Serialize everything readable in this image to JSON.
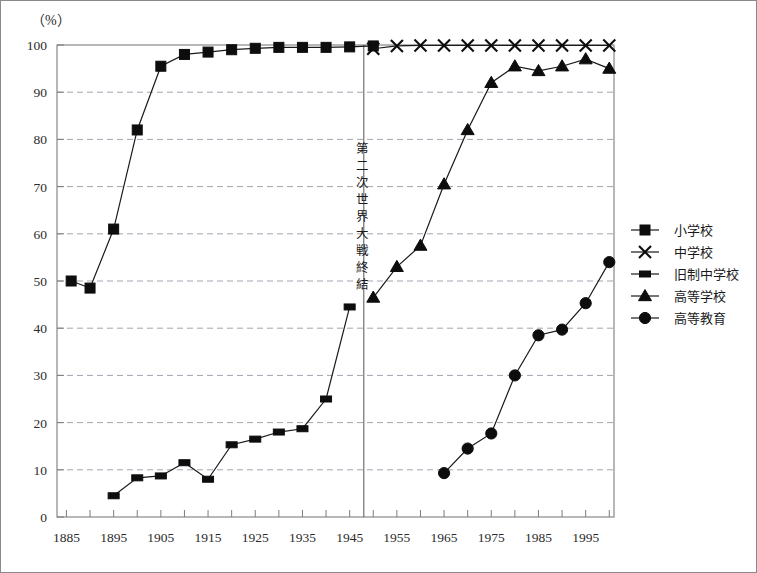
{
  "figure": {
    "unit_label": "（%）",
    "annotation": {
      "text": "第二次世界大戦終結",
      "year": 1948
    }
  },
  "legend": {
    "items": [
      {
        "label": "小学校",
        "marker": "square"
      },
      {
        "label": "中学校",
        "marker": "x"
      },
      {
        "label": "旧制中学校",
        "marker": "small-rect"
      },
      {
        "label": "高等学校",
        "marker": "triangle"
      },
      {
        "label": "高等教育",
        "marker": "circle"
      }
    ]
  },
  "chart_data": {
    "type": "line",
    "title": "",
    "xlabel": "",
    "ylabel": "",
    "unit": "%",
    "xlim": [
      1883,
      2001
    ],
    "ylim": [
      0,
      100
    ],
    "grid": true,
    "legend_position": "right",
    "xticks": [
      1885,
      1895,
      1905,
      1915,
      1925,
      1935,
      1945,
      1955,
      1965,
      1975,
      1985,
      1995
    ],
    "xminor_step": 5,
    "yticks": [
      0,
      10,
      20,
      30,
      40,
      50,
      60,
      70,
      80,
      90,
      100
    ],
    "annotations": [
      {
        "text": "第二次世界大戦終結",
        "x": 1948,
        "orientation": "vertical"
      }
    ],
    "series": [
      {
        "name": "小学校",
        "marker": "square",
        "x": [
          1886,
          1890,
          1895,
          1900,
          1905,
          1910,
          1915,
          1920,
          1925,
          1930,
          1935,
          1940,
          1945,
          1950
        ],
        "values": [
          50.0,
          48.5,
          61.0,
          82.0,
          95.5,
          98.0,
          98.5,
          99.0,
          99.3,
          99.5,
          99.5,
          99.5,
          99.6,
          99.8
        ]
      },
      {
        "name": "中学校",
        "marker": "x",
        "x": [
          1950,
          1955,
          1960,
          1965,
          1970,
          1975,
          1980,
          1985,
          1990,
          1995,
          2000
        ],
        "values": [
          99.2,
          99.8,
          99.9,
          99.9,
          99.9,
          99.9,
          99.9,
          99.9,
          99.9,
          99.9,
          99.9
        ]
      },
      {
        "name": "旧制中学校",
        "marker": "small-rect",
        "x": [
          1895,
          1900,
          1905,
          1910,
          1915,
          1920,
          1925,
          1930,
          1935,
          1940,
          1945
        ],
        "values": [
          4.5,
          8.3,
          8.7,
          11.5,
          8.0,
          15.3,
          16.5,
          18.0,
          18.7,
          25.0,
          44.5
        ]
      },
      {
        "name": "高等学校",
        "marker": "triangle",
        "x": [
          1950,
          1955,
          1960,
          1965,
          1970,
          1975,
          1980,
          1985,
          1990,
          1995,
          2000
        ],
        "values": [
          46.5,
          53.0,
          57.5,
          70.5,
          82.0,
          92.0,
          95.5,
          94.5,
          95.5,
          97.0,
          95.0
        ]
      },
      {
        "name": "高等教育",
        "marker": "circle",
        "x": [
          1965,
          1970,
          1975,
          1980,
          1985,
          1990,
          1995,
          2000
        ],
        "values": [
          9.3,
          14.5,
          17.7,
          30.0,
          38.5,
          39.7,
          45.3,
          54.0
        ]
      }
    ]
  }
}
